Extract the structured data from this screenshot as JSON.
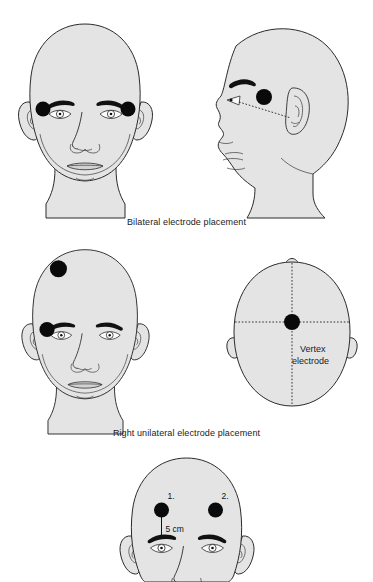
{
  "document": {
    "title": "Electroconvulsive therapy electrode placement diagram",
    "background_color": "#ffffff",
    "skin_fill_color": "#e4e4e4",
    "outline_color": "#2b2b2b",
    "electrode_color": "#0a0a0a"
  },
  "panels": [
    {
      "id": "bilateral",
      "caption": "Bilateral electrode placement",
      "views": [
        {
          "id": "bilateral-frontal",
          "view_type": "frontal",
          "electrodes": [
            {
              "label": "",
              "position": "right temple (viewer left)"
            },
            {
              "label": "",
              "position": "left temple (viewer right)"
            }
          ]
        },
        {
          "id": "bilateral-profile",
          "view_type": "lateral-profile",
          "electrodes": [
            {
              "label": "",
              "position": "temple above canthus-tragus line"
            }
          ],
          "reference_line": "dotted line from outer eye canthus to ear tragus"
        }
      ]
    },
    {
      "id": "unilateral",
      "caption": "Right unilateral electrode placement",
      "views": [
        {
          "id": "unilateral-frontal",
          "view_type": "frontal",
          "electrodes": [
            {
              "label": "",
              "position": "right superior frontal scalp"
            },
            {
              "label": "",
              "position": "right temple"
            }
          ]
        },
        {
          "id": "unilateral-vertex",
          "view_type": "top-down",
          "electrodes": [
            {
              "label": "Vertex\nelectrode",
              "position": "vertex, at crossing of midline and coronal dotted lines"
            }
          ],
          "electrode_label_line1": "Vertex",
          "electrode_label_line2": "electrode",
          "reference_line": "dotted midline (sagittal) and dotted coronal line"
        }
      ]
    },
    {
      "id": "measured",
      "caption": "",
      "views": [
        {
          "id": "measured-frontal",
          "view_type": "frontal-cropped",
          "electrodes": [
            {
              "label": "1.",
              "position": "right frontal, 5 cm above eyebrow"
            },
            {
              "label": "2.",
              "position": "left frontal"
            }
          ],
          "measurement_label": "5 cm",
          "measurement_description": "vertical distance from electrode 1 down to the eyebrow"
        }
      ]
    }
  ]
}
